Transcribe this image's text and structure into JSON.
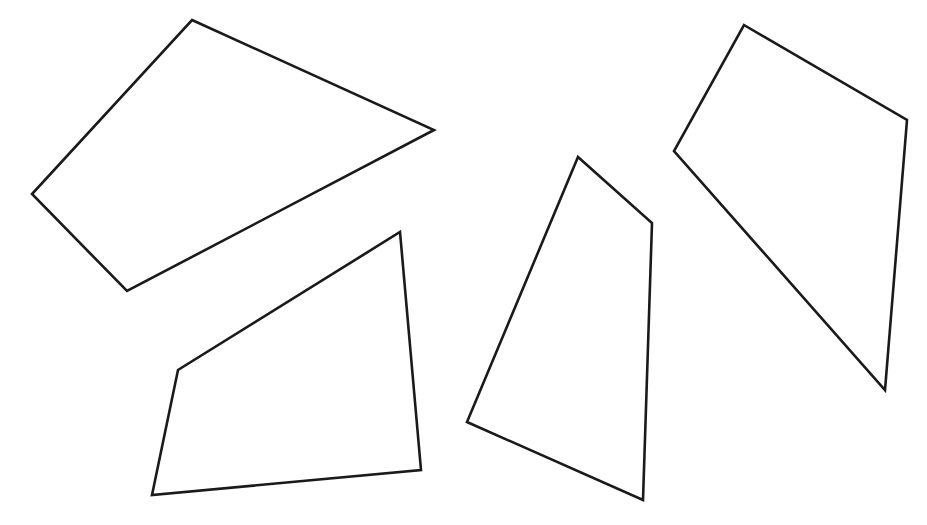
{
  "canvas": {
    "width": 927,
    "height": 525,
    "background_color": "#ffffff",
    "description": "Line drawing of four irregular quadrilateral outlines on a plain white background"
  },
  "style": {
    "stroke_color": "#1a1a1a",
    "fill_color": "#ffffff",
    "stroke_width": 2.6
  },
  "shapes": [
    {
      "id": "quad-1",
      "name": "quadrilateral-top-left",
      "sides": 4,
      "points": "192,20 434,130 127,291 32,194",
      "vertices": [
        {
          "label": "top",
          "x": 192,
          "y": 20
        },
        {
          "label": "right",
          "x": 434,
          "y": 130
        },
        {
          "label": "bottom",
          "x": 127,
          "y": 291
        },
        {
          "label": "left",
          "x": 32,
          "y": 194
        }
      ]
    },
    {
      "id": "quad-2",
      "name": "quadrilateral-bottom-left",
      "sides": 4,
      "points": "400,232 421,470 152,495 178,370",
      "vertices": [
        {
          "label": "top-right",
          "x": 400,
          "y": 232
        },
        {
          "label": "bottom-right",
          "x": 421,
          "y": 470
        },
        {
          "label": "bottom-left",
          "x": 152,
          "y": 495
        },
        {
          "label": "left-bend",
          "x": 178,
          "y": 370
        }
      ]
    },
    {
      "id": "quad-3",
      "name": "quadrilateral-center",
      "sides": 4,
      "points": "578,157 652,223 643,500 467,422",
      "vertices": [
        {
          "label": "top",
          "x": 578,
          "y": 157
        },
        {
          "label": "right-bend",
          "x": 652,
          "y": 223
        },
        {
          "label": "bottom-right",
          "x": 643,
          "y": 500
        },
        {
          "label": "left",
          "x": 467,
          "y": 422
        }
      ]
    },
    {
      "id": "quad-4",
      "name": "quadrilateral-right",
      "sides": 4,
      "points": "744,25 907,120 885,390 674,151",
      "vertices": [
        {
          "label": "top",
          "x": 744,
          "y": 25
        },
        {
          "label": "right",
          "x": 907,
          "y": 120
        },
        {
          "label": "bottom",
          "x": 885,
          "y": 390
        },
        {
          "label": "left",
          "x": 674,
          "y": 151
        }
      ]
    }
  ]
}
